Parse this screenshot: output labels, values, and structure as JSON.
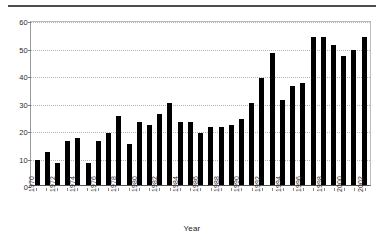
{
  "chart_data": {
    "type": "bar",
    "title": "",
    "subtitle": "",
    "xlabel": "Year",
    "ylabel": "",
    "ylim": [
      0,
      60
    ],
    "yticks": [
      0,
      10,
      20,
      30,
      40,
      50,
      60
    ],
    "ytick_labels": [
      "0",
      "10",
      "20",
      "30",
      "40",
      "50",
      "60"
    ],
    "grid": true,
    "grid_axis": "y",
    "legend": null,
    "legend_position": "none",
    "bar_color": "#000000",
    "categories": [
      "1970",
      "1971",
      "1972",
      "1973",
      "1974",
      "1975",
      "1976",
      "1977",
      "1978",
      "1979",
      "1980",
      "1981",
      "1982",
      "1983",
      "1984",
      "1985",
      "1986",
      "1987",
      "1988",
      "1989",
      "1990",
      "1991",
      "1992",
      "1993",
      "1994",
      "1995",
      "1996",
      "1997",
      "1998",
      "1999",
      "2000",
      "2001",
      "2002"
    ],
    "xtick_labels": [
      "1970",
      "",
      "1972",
      "",
      "1974",
      "",
      "1976",
      "",
      "1978",
      "",
      "1980",
      "",
      "1982",
      "",
      "1984",
      "",
      "1986",
      "",
      "1988",
      "",
      "1990",
      "",
      "1992",
      "",
      "1994",
      "",
      "1996",
      "",
      "1998",
      "",
      "2000",
      "",
      "2002"
    ],
    "values": [
      9,
      12,
      8,
      16,
      17,
      8,
      16,
      19,
      25,
      15,
      23,
      22,
      26,
      30,
      23,
      23,
      19,
      21,
      21,
      22,
      24,
      30,
      39,
      48,
      31,
      36,
      37,
      54,
      54,
      51,
      47,
      49,
      54
    ]
  }
}
